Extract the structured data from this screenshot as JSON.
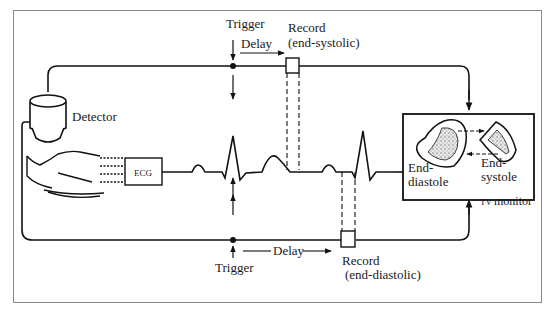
{
  "diagram": {
    "labels": {
      "trigger_top": "Trigger",
      "delay_top": "Delay",
      "record_top_1": "Record",
      "record_top_2": "(end-systolic)",
      "detector": "Detector",
      "ecg": "ECG",
      "end_diastole_1": "End-",
      "end_diastole_2": "diastole",
      "end_systole_1": "End-",
      "end_systole_2": "systole",
      "tv_monitor_tv": "TV",
      "tv_monitor": "monitor",
      "trigger_bottom": "Trigger",
      "delay_bottom": "Delay",
      "record_bottom_1": "Record",
      "record_bottom_2": "(end-diastolic)"
    },
    "colors": {
      "line": "#111111",
      "frame": "#8a8a8a",
      "stipple": "#9a9a9a"
    }
  }
}
